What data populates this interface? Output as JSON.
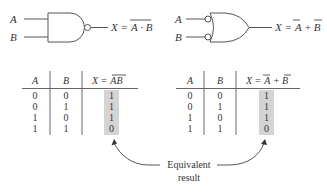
{
  "gates": {
    "nand": {
      "inputs": [
        "A",
        "B"
      ],
      "output_label": "X =",
      "expression": "A · B",
      "expression_overbar": true
    },
    "negative_or": {
      "inputs": [
        "A",
        "B"
      ],
      "output_label": "X =",
      "expr_a": "A",
      "expr_plus": "+",
      "expr_b": "B"
    }
  },
  "tables": {
    "left": {
      "headers": [
        "A",
        "B",
        "X = AB"
      ],
      "header_x": "X =",
      "header_expr": "AB",
      "rows": [
        [
          "0",
          "0",
          "1"
        ],
        [
          "0",
          "1",
          "1"
        ],
        [
          "1",
          "0",
          "1"
        ],
        [
          "1",
          "1",
          "0"
        ]
      ]
    },
    "right": {
      "headers": [
        "A",
        "B",
        "X = A + B"
      ],
      "header_x": "X =",
      "header_a": "A",
      "header_plus": "+",
      "header_b": "B",
      "rows": [
        [
          "0",
          "0",
          "1"
        ],
        [
          "0",
          "1",
          "1"
        ],
        [
          "1",
          "0",
          "1"
        ],
        [
          "1",
          "1",
          "0"
        ]
      ]
    }
  },
  "annotation": {
    "line1": "Equivalent",
    "line2": "result"
  },
  "colors": {
    "highlight": "#d4d4d4",
    "stroke": "#555555",
    "text": "#333333"
  }
}
